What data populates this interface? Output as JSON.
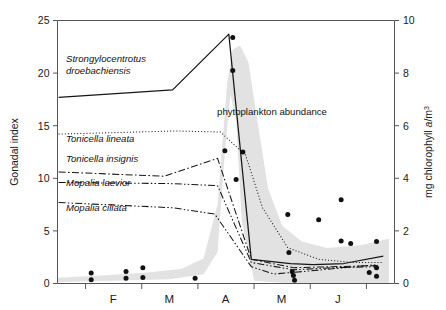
{
  "chart_data": {
    "type": "line",
    "title": "",
    "xlabel": "",
    "ylabel": "Gonadal index",
    "y2label_parts": {
      "pre": "mg chlorophyll ",
      "italic": "a",
      "post": "/m",
      "sup": "3"
    },
    "y2label": "mg chlorophyll a/m3",
    "ylim": [
      0,
      25
    ],
    "y2lim": [
      0,
      10
    ],
    "yticks": [
      "0",
      "5",
      "10",
      "15",
      "20",
      "25"
    ],
    "ytick_values": [
      0,
      5,
      10,
      15,
      20,
      25
    ],
    "y2ticks": [
      "0",
      "2",
      "4",
      "6",
      "8",
      "10"
    ],
    "y2tick_values": [
      0,
      2,
      4,
      6,
      8,
      10
    ],
    "xticks": [
      "F",
      "M",
      "A",
      "M",
      "J"
    ],
    "xtick_labels": [
      "F",
      "M",
      "A",
      "M",
      "J"
    ],
    "xlim_months": [
      1.5,
      6.5
    ],
    "grid": false,
    "legend_position": "inline-labels",
    "annotations": [
      {
        "name": "phytoplankton-abundance",
        "text": "phytoplankton abundance",
        "x": 272,
        "y": 115
      }
    ],
    "series": [
      {
        "name": "Strongylocentrotus droebachiensis",
        "label": "Strongylocentrotus droebachiensis",
        "label_lines": [
          "Strongylocentrotus",
          "droebachiensis"
        ],
        "style": "solid",
        "axis": "left",
        "points": [
          {
            "x": 1.52,
            "y": 17.7
          },
          {
            "x": 3.55,
            "y": 18.4
          },
          {
            "x": 4.55,
            "y": 23.7
          },
          {
            "x": 4.95,
            "y": 2.3
          },
          {
            "x": 5.65,
            "y": 1.9
          },
          {
            "x": 6.05,
            "y": 1.8
          },
          {
            "x": 6.6,
            "y": 1.9
          },
          {
            "x": 7.3,
            "y": 2.6
          }
        ]
      },
      {
        "name": "Tonicella lineata",
        "label": "Tonicella lineata",
        "label_lines": [
          "Tonicella lineata"
        ],
        "style": "dotted",
        "axis": "left",
        "points": [
          {
            "x": 1.52,
            "y": 14.2
          },
          {
            "x": 3.6,
            "y": 14.5
          },
          {
            "x": 4.4,
            "y": 14.4
          },
          {
            "x": 4.85,
            "y": 12.2
          },
          {
            "x": 5.15,
            "y": 7.2
          },
          {
            "x": 5.6,
            "y": 3.4
          },
          {
            "x": 6.15,
            "y": 2.3
          },
          {
            "x": 6.75,
            "y": 2.0
          },
          {
            "x": 7.3,
            "y": 2.0
          }
        ]
      },
      {
        "name": "Tonicella insignis",
        "label": "Tonicella insignis",
        "label_lines": [
          "Tonicella insignis"
        ],
        "style": "dashdot",
        "axis": "left",
        "points": [
          {
            "x": 1.52,
            "y": 10.6
          },
          {
            "x": 3.4,
            "y": 10.2
          },
          {
            "x": 4.35,
            "y": 11.9
          },
          {
            "x": 4.95,
            "y": 2.3
          },
          {
            "x": 5.7,
            "y": 1.5
          },
          {
            "x": 6.4,
            "y": 1.6
          },
          {
            "x": 7.2,
            "y": 1.7
          }
        ]
      },
      {
        "name": "Mopalia laevior",
        "label": "Mopalia laevior",
        "label_lines": [
          "Mopalia laevior"
        ],
        "style": "dashdotdot",
        "axis": "left",
        "points": [
          {
            "x": 1.52,
            "y": 9.6
          },
          {
            "x": 3.5,
            "y": 9.5
          },
          {
            "x": 4.35,
            "y": 9.3
          },
          {
            "x": 4.95,
            "y": 2.0
          },
          {
            "x": 5.7,
            "y": 1.3
          },
          {
            "x": 6.4,
            "y": 1.5
          },
          {
            "x": 7.2,
            "y": 1.6
          }
        ]
      },
      {
        "name": "Mopalia ciliata",
        "label": "Mopalia ciliata",
        "label_lines": [
          "Mopalia ciliata"
        ],
        "style": "dashdotdot",
        "axis": "left",
        "points": [
          {
            "x": 1.52,
            "y": 7.7
          },
          {
            "x": 3.55,
            "y": 7.2
          },
          {
            "x": 4.3,
            "y": 6.6
          },
          {
            "x": 4.95,
            "y": 1.6
          },
          {
            "x": 5.35,
            "y": 0.9
          },
          {
            "x": 6.0,
            "y": 1.2
          },
          {
            "x": 6.6,
            "y": 1.5
          },
          {
            "x": 7.2,
            "y": 1.8
          }
        ]
      }
    ],
    "shaded_band": {
      "name": "phytoplankton abundance",
      "axis": "right",
      "fill": "#e2e2e2",
      "upper": [
        {
          "x": 1.5,
          "y": 0.22
        },
        {
          "x": 2.3,
          "y": 0.3
        },
        {
          "x": 3.1,
          "y": 0.42
        },
        {
          "x": 3.7,
          "y": 0.55
        },
        {
          "x": 4.1,
          "y": 0.95
        },
        {
          "x": 4.35,
          "y": 3.0
        },
        {
          "x": 4.52,
          "y": 7.6
        },
        {
          "x": 4.62,
          "y": 8.9
        },
        {
          "x": 4.75,
          "y": 9.05
        },
        {
          "x": 4.9,
          "y": 8.4
        },
        {
          "x": 5.05,
          "y": 6.3
        },
        {
          "x": 5.25,
          "y": 3.6
        },
        {
          "x": 5.5,
          "y": 2.2
        },
        {
          "x": 5.85,
          "y": 1.6
        },
        {
          "x": 6.3,
          "y": 1.35
        },
        {
          "x": 6.9,
          "y": 1.45
        },
        {
          "x": 7.4,
          "y": 1.7
        }
      ],
      "lower": [
        {
          "x": 7.4,
          "y": 0.02
        },
        {
          "x": 6.3,
          "y": 0.02
        },
        {
          "x": 5.5,
          "y": 0.03
        },
        {
          "x": 5.0,
          "y": 0.1
        },
        {
          "x": 4.78,
          "y": 2.4
        },
        {
          "x": 4.68,
          "y": 6.2
        },
        {
          "x": 4.58,
          "y": 7.2
        },
        {
          "x": 4.48,
          "y": 5.0
        },
        {
          "x": 4.35,
          "y": 1.2
        },
        {
          "x": 4.1,
          "y": 0.35
        },
        {
          "x": 3.5,
          "y": 0.16
        },
        {
          "x": 2.5,
          "y": 0.1
        },
        {
          "x": 1.5,
          "y": 0.06
        }
      ]
    },
    "scatter": {
      "name": "chlorophyll-measurements",
      "axis": "right",
      "marker": "filled-circle",
      "color": "#111111",
      "points": [
        {
          "x": 2.1,
          "y": 0.4
        },
        {
          "x": 2.1,
          "y": 0.14
        },
        {
          "x": 2.72,
          "y": 0.46
        },
        {
          "x": 2.72,
          "y": 0.2
        },
        {
          "x": 3.02,
          "y": 0.6
        },
        {
          "x": 3.02,
          "y": 0.23
        },
        {
          "x": 3.95,
          "y": 0.2
        },
        {
          "x": 4.62,
          "y": 9.35
        },
        {
          "x": 4.62,
          "y": 8.1
        },
        {
          "x": 4.48,
          "y": 5.05
        },
        {
          "x": 4.8,
          "y": 5.0
        },
        {
          "x": 4.68,
          "y": 3.95
        },
        {
          "x": 5.6,
          "y": 2.62
        },
        {
          "x": 5.68,
          "y": 0.45
        },
        {
          "x": 5.7,
          "y": 0.3
        },
        {
          "x": 5.72,
          "y": 0.12
        },
        {
          "x": 5.62,
          "y": 1.18
        },
        {
          "x": 6.15,
          "y": 2.42
        },
        {
          "x": 6.55,
          "y": 3.18
        },
        {
          "x": 6.55,
          "y": 1.62
        },
        {
          "x": 6.72,
          "y": 1.52
        },
        {
          "x": 7.18,
          "y": 1.6
        },
        {
          "x": 7.18,
          "y": 0.6
        },
        {
          "x": 7.05,
          "y": 0.42
        },
        {
          "x": 7.18,
          "y": 0.28
        }
      ]
    }
  },
  "axes": {
    "left_title": "Gonadal index",
    "right_title": "mg chlorophyll a/m3"
  }
}
